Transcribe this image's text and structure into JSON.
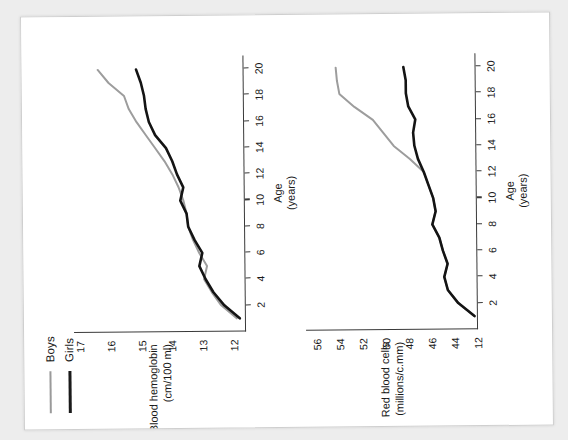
{
  "legend": {
    "items": [
      {
        "label": "Boys",
        "color": "#9d9d9d"
      },
      {
        "label": "Girls",
        "color": "#141414"
      }
    ]
  },
  "chart_data": [
    {
      "type": "line",
      "id": "blood-hemoglobin",
      "title": "",
      "ylabel": "Blood hemoglobin\n(cm/100 ml)",
      "ylabel_line1": "Blood hemoglobin",
      "ylabel_line2": "(cm/100 ml)",
      "xlabel_line1": "Age",
      "xlabel_line2": "(years)",
      "xlabel": "Age (years)",
      "grid": false,
      "legend_position": "top-left",
      "xlim": [
        0,
        21
      ],
      "ylim": [
        11.6,
        17.2
      ],
      "xticks": [
        2,
        4,
        6,
        8,
        10,
        12,
        14,
        16,
        18,
        20
      ],
      "yticks": [
        12,
        13,
        14,
        15,
        16,
        17
      ],
      "x": [
        1,
        2,
        3,
        4,
        5,
        6,
        7,
        8,
        9,
        10,
        11,
        12,
        13,
        14,
        15,
        16,
        17,
        18,
        19,
        20
      ],
      "series": [
        {
          "name": "Boys",
          "color": "#9d9d9d",
          "values": [
            11.9,
            12.4,
            12.7,
            12.95,
            12.85,
            13.1,
            13.3,
            13.45,
            13.5,
            13.6,
            13.75,
            13.95,
            14.2,
            14.5,
            14.8,
            15.1,
            15.35,
            15.5,
            16.0,
            16.35
          ]
        },
        {
          "name": "Girls",
          "color": "#141414",
          "values": [
            11.8,
            12.3,
            12.65,
            12.9,
            13.1,
            13.0,
            13.25,
            13.45,
            13.5,
            13.7,
            13.6,
            13.8,
            13.95,
            14.15,
            14.5,
            14.7,
            14.8,
            14.85,
            14.95,
            15.1
          ]
        }
      ]
    },
    {
      "type": "line",
      "id": "red-blood-cells",
      "title": "",
      "ylabel_line1": "Red blood cells",
      "ylabel_line2": "(millions/c.mm)",
      "ylabel": "Red blood cells\n(millions/c.mm)",
      "xlabel_line1": "Age",
      "xlabel_line2": "(years)",
      "xlabel": "Age (years)",
      "grid": false,
      "legend_position": "top-left",
      "xlim": [
        0,
        21
      ],
      "ylim": [
        42,
        57
      ],
      "xticks": [
        2,
        4,
        6,
        8,
        10,
        12,
        14,
        16,
        18,
        20
      ],
      "yticks": [
        56,
        54,
        52,
        50,
        48,
        46,
        44,
        12
      ],
      "ytick_positions": [
        56,
        54,
        52,
        50,
        48,
        46,
        44,
        42
      ],
      "x": [
        1,
        2,
        3,
        4,
        5,
        6,
        7,
        8,
        9,
        10,
        11,
        12,
        13,
        14,
        15,
        16,
        17,
        18,
        19,
        20
      ],
      "series": [
        {
          "name": "Boys",
          "color": "#9d9d9d",
          "values": [
            42.3,
            43.7,
            44.6,
            44.9,
            44.6,
            45.0,
            45.3,
            45.9,
            45.6,
            45.8,
            46.2,
            46.6,
            47.8,
            49.2,
            50.1,
            51.0,
            52.6,
            53.9,
            54.1,
            54.2
          ]
        },
        {
          "name": "Girls",
          "color": "#141414",
          "values": [
            42.3,
            43.7,
            44.6,
            44.9,
            44.6,
            45.0,
            45.3,
            45.9,
            45.6,
            45.8,
            46.2,
            46.6,
            47.1,
            47.4,
            47.5,
            47.3,
            47.9,
            48.1,
            48.1,
            48.3
          ]
        }
      ]
    }
  ]
}
